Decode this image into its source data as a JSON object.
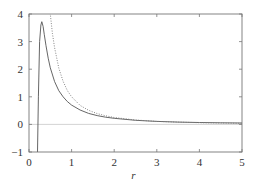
{
  "chart_data": {
    "type": "line",
    "title": "",
    "xlabel": "r",
    "ylabel": "",
    "xlim": [
      0,
      5
    ],
    "ylim": [
      -1,
      4
    ],
    "xticks": [
      0,
      1,
      2,
      3,
      4,
      5
    ],
    "yticks": [
      -1,
      0,
      1,
      2,
      3,
      4
    ],
    "grid": false,
    "legend": null,
    "reference_line": {
      "y": 0,
      "color": "#c8c8c8"
    },
    "series": [
      {
        "name": "solid",
        "style": "solid",
        "color": "#555555",
        "x": [
          0.2,
          0.22,
          0.25,
          0.28,
          0.3,
          0.33,
          0.36,
          0.4,
          0.45,
          0.5,
          0.6,
          0.7,
          0.8,
          0.9,
          1.0,
          1.2,
          1.4,
          1.6,
          1.8,
          2.0,
          2.5,
          3.0,
          3.5,
          4.0,
          4.5,
          5.0
        ],
        "y": [
          -1.0,
          1.0,
          3.0,
          3.6,
          3.72,
          3.55,
          3.25,
          2.85,
          2.4,
          2.05,
          1.55,
          1.22,
          1.0,
          0.83,
          0.7,
          0.52,
          0.4,
          0.32,
          0.26,
          0.22,
          0.15,
          0.11,
          0.085,
          0.07,
          0.058,
          0.05
        ]
      },
      {
        "name": "dotted",
        "style": "dotted",
        "color": "#777777",
        "x": [
          0.48,
          0.5,
          0.55,
          0.6,
          0.7,
          0.8,
          0.9,
          1.0,
          1.2,
          1.4,
          1.6,
          1.8,
          2.0,
          2.5,
          3.0,
          3.5,
          4.0,
          4.5,
          5.0
        ],
        "y": [
          4.3,
          4.0,
          3.3,
          2.78,
          2.04,
          1.56,
          1.23,
          1.0,
          0.69,
          0.51,
          0.39,
          0.31,
          0.25,
          0.16,
          0.11,
          0.082,
          0.0625,
          0.049,
          0.04
        ]
      }
    ]
  },
  "axes": {
    "x_tick_labels": [
      "0",
      "1",
      "2",
      "3",
      "4",
      "5"
    ],
    "y_tick_labels": [
      "−1",
      "0",
      "1",
      "2",
      "3",
      "4"
    ],
    "x_label": "r"
  },
  "colors": {
    "frame": "#777777",
    "zero_line": "#c8c8c8",
    "text": "#333333"
  }
}
